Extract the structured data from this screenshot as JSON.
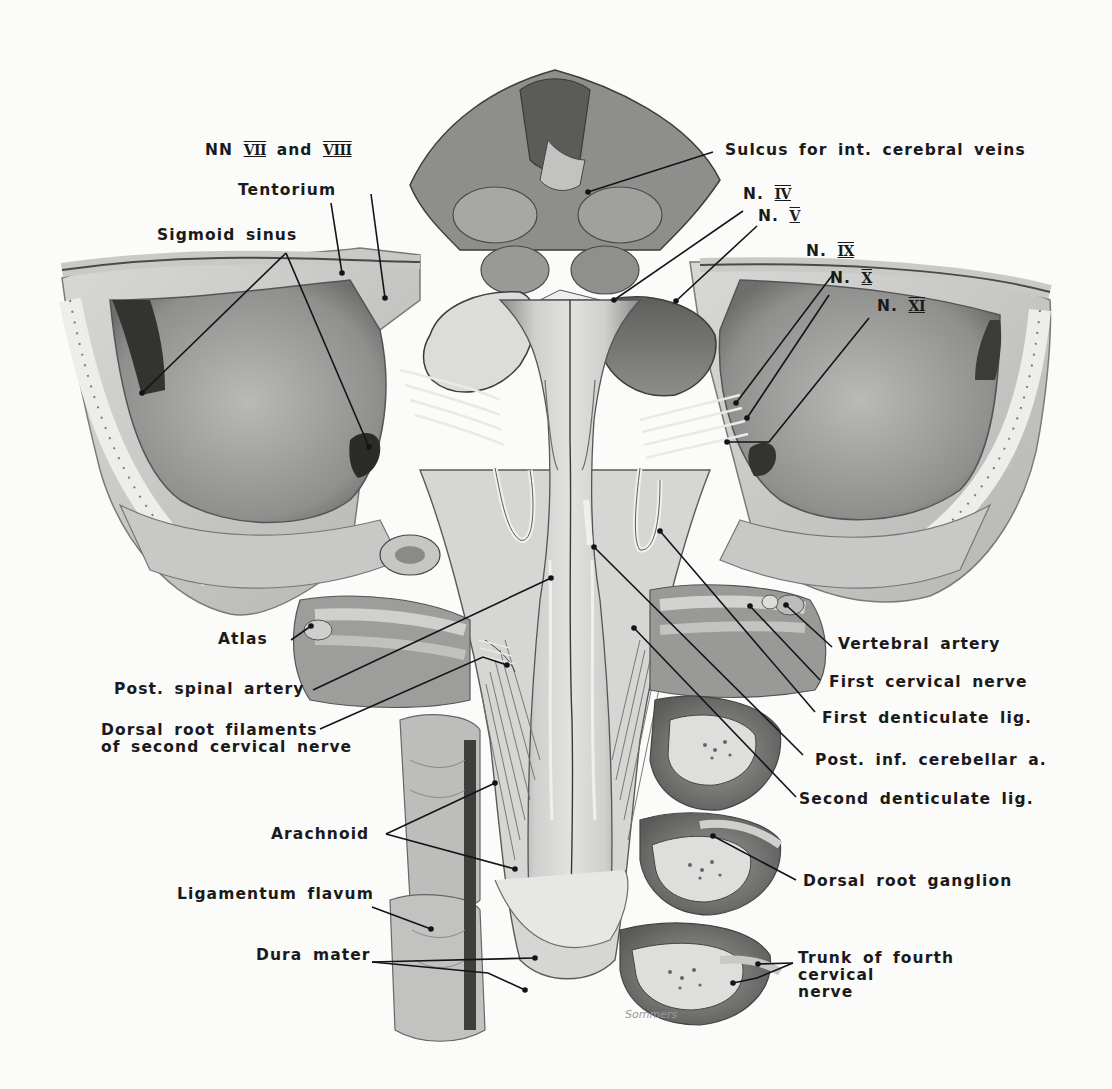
{
  "figure": {
    "signature": "Sommers",
    "colors": {
      "paper": "#fbfbfa",
      "ink": "#1a1a1a",
      "bone": "#e4e4e2",
      "tissue_mid": "#9a9a98",
      "tissue_dark": "#555555",
      "sinus": "#2e2e2e"
    }
  },
  "labels": {
    "nn_vii_viii": {
      "prefix": "NN",
      "rn1": "VII",
      "mid": "and",
      "rn2": "VIII"
    },
    "tentorium": "Tentorium",
    "sigmoid_sinus": "Sigmoid sinus",
    "sulcus": "Sulcus for int. cerebral veins",
    "n_iv": {
      "prefix": "N.",
      "rn": "IV"
    },
    "n_v": {
      "prefix": "N.",
      "rn": "V"
    },
    "n_ix": {
      "prefix": "N.",
      "rn": "IX"
    },
    "n_x": {
      "prefix": "N.",
      "rn": "X"
    },
    "n_xi": {
      "prefix": "N.",
      "rn": "XI"
    },
    "atlas": "Atlas",
    "post_spinal_artery": "Post. spinal artery",
    "dorsal_root_filaments": "Dorsal root filaments\nof second cervical nerve",
    "vertebral_artery": "Vertebral artery",
    "first_cervical_nerve": "First cervical nerve",
    "first_denticulate_lig": "First denticulate lig.",
    "post_inf_cerebellar_a": "Post. inf. cerebellar a.",
    "second_denticulate_lig": "Second denticulate lig.",
    "arachnoid": "Arachnoid",
    "dorsal_root_ganglion": "Dorsal root ganglion",
    "ligamentum_flavum": "Ligamentum flavum",
    "dura_mater": "Dura mater",
    "trunk_fourth_cervical": "Trunk of fourth\ncervical\nnerve"
  },
  "leaders": [
    {
      "name": "leader-nn-vii-viii",
      "points": [
        [
          371,
          194
        ],
        [
          385,
          298
        ]
      ]
    },
    {
      "name": "leader-tentorium",
      "points": [
        [
          331,
          203
        ],
        [
          342,
          273
        ]
      ]
    },
    {
      "name": "leader-sigmoid-left",
      "points": [
        [
          286,
          253
        ],
        [
          142,
          393
        ]
      ]
    },
    {
      "name": "leader-sigmoid-right",
      "points": [
        [
          286,
          253
        ],
        [
          369,
          447
        ]
      ]
    },
    {
      "name": "leader-sulcus",
      "points": [
        [
          713,
          152
        ],
        [
          588,
          192
        ]
      ]
    },
    {
      "name": "leader-n-iv",
      "points": [
        [
          743,
          211
        ],
        [
          614,
          300
        ]
      ]
    },
    {
      "name": "leader-n-v",
      "points": [
        [
          757,
          226
        ],
        [
          676,
          301
        ]
      ]
    },
    {
      "name": "leader-n-ix",
      "points": [
        [
          834,
          273
        ],
        [
          736,
          403
        ]
      ]
    },
    {
      "name": "leader-n-x",
      "points": [
        [
          829,
          295
        ],
        [
          747,
          418
        ]
      ]
    },
    {
      "name": "leader-n-xi",
      "points": [
        [
          869,
          318
        ],
        [
          769,
          442
        ],
        [
          727,
          442
        ]
      ]
    },
    {
      "name": "leader-atlas",
      "points": [
        [
          291,
          640
        ],
        [
          311,
          626
        ]
      ]
    },
    {
      "name": "leader-post-spinal",
      "points": [
        [
          313,
          690
        ],
        [
          551,
          578
        ]
      ]
    },
    {
      "name": "leader-dorsal-root",
      "points": [
        [
          320,
          729
        ],
        [
          483,
          657
        ],
        [
          507,
          665
        ]
      ]
    },
    {
      "name": "leader-vertebral",
      "points": [
        [
          832,
          647
        ],
        [
          786,
          605
        ]
      ]
    },
    {
      "name": "leader-first-cervical",
      "points": [
        [
          820,
          680
        ],
        [
          750,
          606
        ]
      ]
    },
    {
      "name": "leader-first-dent",
      "points": [
        [
          815,
          712
        ],
        [
          660,
          531
        ]
      ]
    },
    {
      "name": "leader-post-inf-cereb",
      "points": [
        [
          803,
          755
        ],
        [
          594,
          547
        ]
      ]
    },
    {
      "name": "leader-second-dent",
      "points": [
        [
          796,
          797
        ],
        [
          634,
          628
        ]
      ]
    },
    {
      "name": "leader-arachnoid-up",
      "points": [
        [
          386,
          834
        ],
        [
          495,
          783
        ]
      ]
    },
    {
      "name": "leader-arachnoid-down",
      "points": [
        [
          386,
          834
        ],
        [
          515,
          869
        ]
      ]
    },
    {
      "name": "leader-drg",
      "points": [
        [
          796,
          880
        ],
        [
          713,
          836
        ]
      ]
    },
    {
      "name": "leader-lig-flavum",
      "points": [
        [
          372,
          907
        ],
        [
          431,
          929
        ]
      ]
    },
    {
      "name": "leader-dura-up",
      "points": [
        [
          372,
          962
        ],
        [
          535,
          958
        ]
      ]
    },
    {
      "name": "leader-dura-down",
      "points": [
        [
          372,
          962
        ],
        [
          488,
          973
        ],
        [
          525,
          990
        ]
      ]
    },
    {
      "name": "leader-trunk-up",
      "points": [
        [
          793,
          963
        ],
        [
          758,
          964
        ]
      ]
    },
    {
      "name": "leader-trunk-down",
      "points": [
        [
          793,
          963
        ],
        [
          757,
          978
        ],
        [
          733,
          983
        ]
      ]
    }
  ]
}
